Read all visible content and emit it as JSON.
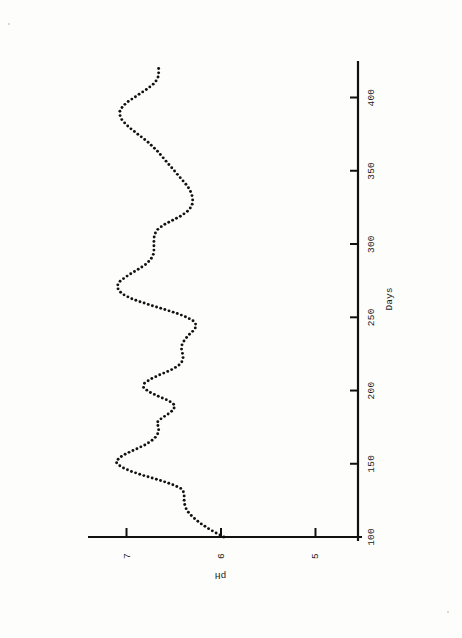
{
  "document": {
    "caption": "Figure 4.  The pH in a completely stirred 5-L digester.",
    "figure_number": "Figure 4.",
    "caption_body": "The pH in a completely stirred 5-L digester."
  },
  "chart_data": {
    "type": "line",
    "title": "",
    "subtitle": "",
    "xlabel": "Days",
    "ylabel": "pH",
    "xlim": [
      100,
      425
    ],
    "ylim": [
      4.55,
      7.45
    ],
    "xticks": [
      100,
      150,
      200,
      250,
      300,
      350,
      400
    ],
    "xtick_labels": [
      "100",
      "150",
      "200",
      "250",
      "300",
      "350",
      "400"
    ],
    "yticks": [
      5,
      6,
      7
    ],
    "ytick_labels": [
      "5",
      "6",
      "7"
    ],
    "grid": false,
    "legend": false,
    "legend_position": "none",
    "marker": "dotted-line",
    "line_color": "#111111",
    "orientation_note": "figure printed landscape; scan is rotated 90 degrees counter-clockwise",
    "series": [
      {
        "name": "pH",
        "x": [
          100,
          103,
          106,
          109,
          112,
          115,
          118,
          121,
          124,
          127,
          130,
          133,
          136,
          139,
          142,
          145,
          148,
          151,
          154,
          157,
          160,
          163,
          166,
          169,
          172,
          175,
          178,
          181,
          184,
          187,
          190,
          193,
          196,
          199,
          202,
          205,
          208,
          211,
          214,
          217,
          220,
          223,
          226,
          229,
          232,
          235,
          238,
          241,
          244,
          247,
          250,
          253,
          256,
          259,
          262,
          265,
          268,
          271,
          274,
          277,
          280,
          283,
          286,
          289,
          292,
          295,
          298,
          301,
          304,
          307,
          310,
          313,
          316,
          319,
          322,
          325,
          328,
          331,
          334,
          337,
          340,
          343,
          346,
          349,
          352,
          355,
          358,
          361,
          364,
          367,
          370,
          373,
          376,
          379,
          382,
          385,
          388,
          391,
          394,
          397,
          400,
          403,
          406,
          409,
          412,
          415,
          418,
          421
        ],
        "y": [
          5.97,
          6.06,
          6.14,
          6.21,
          6.27,
          6.32,
          6.36,
          6.38,
          6.39,
          6.39,
          6.39,
          6.42,
          6.52,
          6.66,
          6.82,
          6.96,
          7.06,
          7.11,
          7.08,
          7.0,
          6.9,
          6.8,
          6.73,
          6.68,
          6.66,
          6.66,
          6.68,
          6.63,
          6.56,
          6.5,
          6.49,
          6.55,
          6.66,
          6.76,
          6.82,
          6.81,
          6.74,
          6.64,
          6.53,
          6.45,
          6.41,
          6.4,
          6.41,
          6.42,
          6.41,
          6.38,
          6.34,
          6.29,
          6.26,
          6.28,
          6.36,
          6.48,
          6.63,
          6.78,
          6.92,
          7.02,
          7.08,
          7.1,
          7.08,
          7.02,
          6.95,
          6.87,
          6.8,
          6.75,
          6.72,
          6.71,
          6.71,
          6.71,
          6.71,
          6.7,
          6.67,
          6.61,
          6.52,
          6.43,
          6.36,
          6.32,
          6.3,
          6.3,
          6.31,
          6.33,
          6.36,
          6.4,
          6.44,
          6.48,
          6.52,
          6.56,
          6.6,
          6.64,
          6.68,
          6.73,
          6.78,
          6.84,
          6.9,
          6.96,
          7.01,
          7.05,
          7.07,
          7.07,
          7.04,
          6.99,
          6.92,
          6.85,
          6.78,
          6.72,
          6.68,
          6.66,
          6.66,
          6.66
        ]
      }
    ],
    "annotations": []
  },
  "axes": {
    "x_axis_name": "days-axis",
    "y_axis_name": "ph-axis"
  }
}
